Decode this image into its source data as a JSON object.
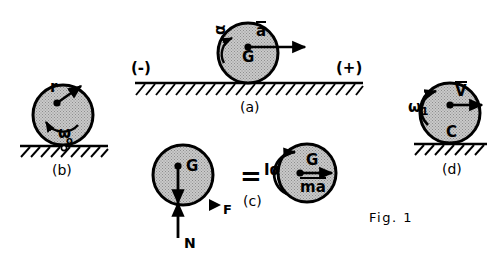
{
  "figure": {
    "caption": "Fig. 1",
    "panels": [
      {
        "id": "a",
        "caption": "(a)",
        "labels": {
          "center": "G",
          "acceleration": "a",
          "angular_accel": "α",
          "sign_negative": "(-)",
          "sign_positive": "(+)"
        }
      },
      {
        "id": "b",
        "caption": "(b)",
        "labels": {
          "radius": "r",
          "angular_velocity": "ω",
          "contact_point": "o"
        }
      },
      {
        "id": "c",
        "caption": "(c)",
        "equals": "=",
        "left": {
          "center": "G",
          "friction": "F",
          "normal": "N"
        },
        "right": {
          "center": "G",
          "inertia_couple": "Iα",
          "inertia_force": "ma",
          "inertia_force_alpha": "α"
        }
      },
      {
        "id": "d",
        "caption": "(d)",
        "labels": {
          "angular_velocity": "ω",
          "angular_velocity_sub": "1",
          "velocity": "V",
          "contact_point": "C"
        }
      }
    ]
  },
  "colors": {
    "ink": "#000000",
    "disk_fill": "#b9b9b9",
    "disk_edge": "#000000",
    "page": "#ffffff"
  }
}
